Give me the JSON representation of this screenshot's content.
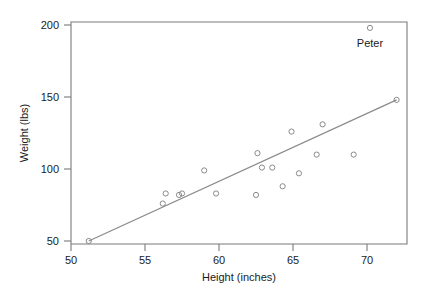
{
  "chart_data": {
    "type": "scatter",
    "title": "",
    "xlabel": "Height (inches)",
    "ylabel": "Weight (lbs)",
    "xlim": [
      49.0,
      72.6
    ],
    "ylim": [
      45,
      202
    ],
    "xticks": [
      50,
      55,
      60,
      65,
      70
    ],
    "yticks": [
      50,
      100,
      150,
      200
    ],
    "xtick_labels": [
      "50",
      "55",
      "60",
      "65",
      "70"
    ],
    "ytick_labels": [
      "50",
      "100",
      "150",
      "200"
    ],
    "grid": false,
    "legend": "none",
    "points": [
      {
        "x": 51.2,
        "y": 50,
        "label": ""
      },
      {
        "x": 56.2,
        "y": 76,
        "label": ""
      },
      {
        "x": 56.4,
        "y": 83,
        "label": ""
      },
      {
        "x": 57.3,
        "y": 82,
        "label": ""
      },
      {
        "x": 57.5,
        "y": 83,
        "label": ""
      },
      {
        "x": 59.0,
        "y": 99,
        "label": ""
      },
      {
        "x": 59.8,
        "y": 83,
        "label": ""
      },
      {
        "x": 62.5,
        "y": 82,
        "label": ""
      },
      {
        "x": 62.6,
        "y": 111,
        "label": ""
      },
      {
        "x": 62.9,
        "y": 101,
        "label": ""
      },
      {
        "x": 63.6,
        "y": 101,
        "label": ""
      },
      {
        "x": 64.3,
        "y": 88,
        "label": ""
      },
      {
        "x": 64.9,
        "y": 126,
        "label": ""
      },
      {
        "x": 65.4,
        "y": 97,
        "label": ""
      },
      {
        "x": 66.6,
        "y": 110,
        "label": ""
      },
      {
        "x": 67.0,
        "y": 131,
        "label": ""
      },
      {
        "x": 69.1,
        "y": 110,
        "label": ""
      },
      {
        "x": 70.2,
        "y": 198,
        "label": "Peter"
      },
      {
        "x": 72.0,
        "y": 148,
        "label": ""
      }
    ],
    "fit_line": {
      "x1": 51.2,
      "y1": 50,
      "x2": 72.0,
      "y2": 148
    },
    "annotations": [
      {
        "text": "Peter",
        "x": 70.2,
        "y": 185
      }
    ]
  },
  "colors": {
    "axis": "#7a7a7a",
    "marker": "#8a8a8a",
    "line": "#8a8a8a",
    "text": "#1a1a1a",
    "background": "#ffffff"
  }
}
